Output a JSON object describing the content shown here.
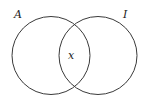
{
  "diagram": {
    "type": "venn",
    "sets": [
      {
        "label": "A",
        "cx": 51,
        "cy": 55.5,
        "r": 39,
        "label_x": 14,
        "label_y": 18
      },
      {
        "label": "I",
        "cx": 98,
        "cy": 55.5,
        "r": 39,
        "label_x": 123,
        "label_y": 18
      }
    ],
    "intersection": {
      "label": "x",
      "x": 68,
      "y": 59
    },
    "colors": {
      "stroke": "#3a3a3a",
      "text": "#222222",
      "background": "#ffffff"
    }
  }
}
